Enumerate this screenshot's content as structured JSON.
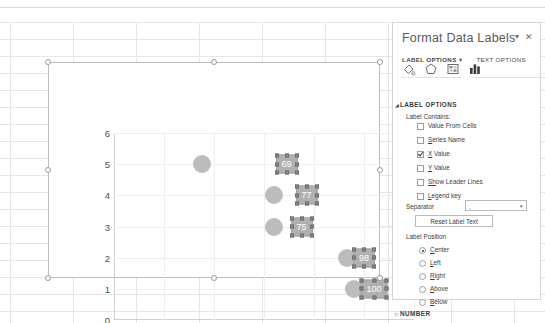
{
  "worksheet": {
    "background": "#ffffff",
    "gridline_color": "#e6e6e6"
  },
  "chart": {
    "name": "bubble-chart",
    "y_axis": {
      "ticks": [
        "0",
        "1",
        "2",
        "3",
        "4",
        "5",
        "6"
      ],
      "min": 0,
      "max": 6
    },
    "x_axis": {
      "ticks": [
        "0",
        "20",
        "40",
        "60",
        "80",
        "100",
        "120"
      ],
      "min": 0,
      "max": 120
    },
    "bubble_color": "#bcbcbc",
    "label_fill": "#b0b0b0",
    "label_text_color": "#ffffff"
  },
  "chart_data": {
    "type": "scatter",
    "title": "",
    "xlabel": "",
    "ylabel": "",
    "xlim": [
      0,
      120
    ],
    "ylim": [
      0,
      6
    ],
    "grid": true,
    "legend": false,
    "series": [
      {
        "name": "Series 1",
        "points": [
          {
            "x": 35,
            "y": 5,
            "label": "",
            "r": 9,
            "label_dx": 0,
            "label_dy": 0
          },
          {
            "x": 69,
            "y": 5,
            "label": "69",
            "r": 0,
            "label_dx": 0,
            "label_dy": 0
          },
          {
            "x": 64,
            "y": 4,
            "label": "",
            "r": 9,
            "label_dx": 0,
            "label_dy": 0
          },
          {
            "x": 77,
            "y": 4,
            "label": "77",
            "r": 0,
            "label_dx": 0,
            "label_dy": 0
          },
          {
            "x": 64,
            "y": 3,
            "label": "",
            "r": 9,
            "label_dx": 0,
            "label_dy": 0
          },
          {
            "x": 75,
            "y": 3,
            "label": "75",
            "r": 0,
            "label_dx": 0,
            "label_dy": 0
          },
          {
            "x": 93,
            "y": 2,
            "label": "",
            "r": 9,
            "label_dx": 0,
            "label_dy": 0
          },
          {
            "x": 100,
            "y": 2,
            "label": "98",
            "r": 0,
            "label_dx": 0,
            "label_dy": 0
          },
          {
            "x": 96,
            "y": 1,
            "label": "",
            "r": 9,
            "label_dx": 0,
            "label_dy": 0
          },
          {
            "x": 104,
            "y": 1,
            "label": "100",
            "r": 0,
            "label_dx": 0,
            "label_dy": 0
          }
        ]
      }
    ],
    "data_labels": [
      "69",
      "77",
      "75",
      "98",
      "100"
    ]
  },
  "pane": {
    "title": "Format Data Labels",
    "dropdown_icon": "chevron-down-icon",
    "close_icon": "close-icon",
    "tabs": [
      {
        "label": "LABEL OPTIONS",
        "caret": "▾",
        "active": true
      },
      {
        "label": "TEXT OPTIONS",
        "caret": "",
        "active": false
      }
    ],
    "icons": [
      {
        "name": "fill-line-icon",
        "selected": false
      },
      {
        "name": "effects-icon",
        "selected": false
      },
      {
        "name": "size-properties-icon",
        "selected": false
      },
      {
        "name": "label-options-icon",
        "selected": true
      }
    ],
    "section_label_options": {
      "triangle": "◢",
      "title": "LABEL OPTIONS",
      "label_contains_title": "Label Contains:",
      "checkboxes": [
        {
          "label": "Value From Cells",
          "underline": "F",
          "checked": false
        },
        {
          "label": "Series Name",
          "underline": "S",
          "checked": false
        },
        {
          "label": "X Value",
          "underline": "X",
          "checked": true
        },
        {
          "label": "Y Value",
          "underline": "Y",
          "checked": false
        },
        {
          "label": "Show Leader Lines",
          "underline": "Sh",
          "checked": false
        },
        {
          "label": "Legend key",
          "underline": "L",
          "checked": false
        }
      ],
      "separator": {
        "label": "Separator",
        "value": ",",
        "caret": "▾"
      },
      "reset_button": "Reset Label Text",
      "label_position_title": "Label Position",
      "radios": [
        {
          "label": "Center",
          "selected": true
        },
        {
          "label": "Left",
          "selected": false
        },
        {
          "label": "Right",
          "selected": false
        },
        {
          "label": "Above",
          "selected": false
        },
        {
          "label": "Below",
          "selected": false
        }
      ]
    },
    "section_number": {
      "triangle": "▷",
      "title": "NUMBER"
    }
  }
}
